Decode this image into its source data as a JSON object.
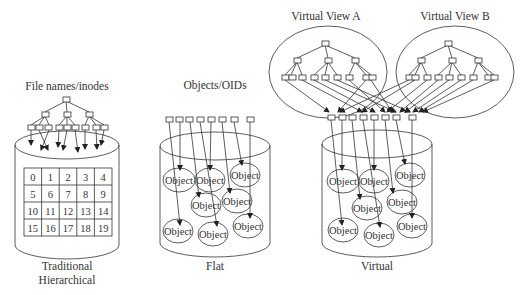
{
  "panels": {
    "traditional": {
      "top_label": "File names/inodes",
      "bottom_label_line1": "Traditional",
      "bottom_label_line2": "Hierarchical",
      "grid": [
        [
          "0",
          "1",
          "2",
          "3",
          "4"
        ],
        [
          "5",
          "6",
          "7",
          "8",
          "9"
        ],
        [
          "10",
          "11",
          "12",
          "13",
          "14"
        ],
        [
          "15",
          "16",
          "17",
          "18",
          "19"
        ]
      ]
    },
    "flat": {
      "top_label": "Objects/OIDs",
      "bottom_label": "Flat",
      "object_label": "Object",
      "object_count": 8,
      "oid_count": 8
    },
    "virtual": {
      "view_a_label": "Virtual View A",
      "view_b_label": "Virtual View B",
      "bottom_label": "Virtual",
      "object_label": "Object",
      "object_count": 8,
      "oid_count": 8
    }
  },
  "colors": {
    "stroke": "#333333",
    "background": "#ffffff"
  }
}
